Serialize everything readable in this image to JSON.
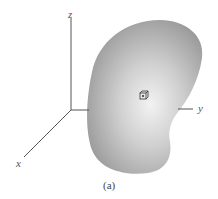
{
  "figure": {
    "caption": "(a)",
    "axes": {
      "x_label": "x",
      "y_label": "y",
      "z_label": "z"
    },
    "body": {
      "description": "irregular kidney-shaped body",
      "fill_color": "#9a9a9a",
      "highlight_color": "#ececec"
    },
    "element": {
      "description": "small cube volume element with point at center"
    },
    "axis_color": "#555555"
  }
}
